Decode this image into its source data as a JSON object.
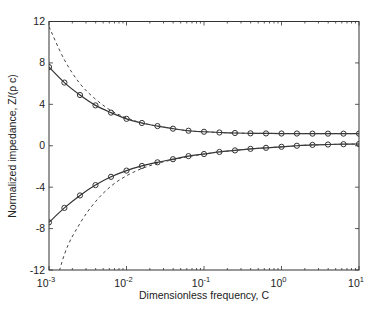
{
  "chart_data": {
    "type": "line",
    "title": "",
    "xlabel": "Dimensionless frequency, C",
    "ylabel": "Normalized impedance, Z/(ρ c)",
    "xscale": "log",
    "xlim": [
      0.001,
      10
    ],
    "ylim": [
      -12,
      12
    ],
    "grid": false,
    "legend": null,
    "x_ticks": [
      {
        "value": 0.001,
        "base": "10",
        "exp": "-3"
      },
      {
        "value": 0.01,
        "base": "10",
        "exp": "-2"
      },
      {
        "value": 0.1,
        "base": "10",
        "exp": "-1"
      },
      {
        "value": 1,
        "base": "10",
        "exp": "0"
      },
      {
        "value": 10,
        "base": "10",
        "exp": "1"
      }
    ],
    "y_ticks": [
      {
        "value": 12,
        "label": "12"
      },
      {
        "value": 8,
        "label": "8"
      },
      {
        "value": 4,
        "label": "4"
      },
      {
        "value": 0,
        "label": "0"
      },
      {
        "value": -4,
        "label": "-4"
      },
      {
        "value": -8,
        "label": "-8"
      },
      {
        "value": -12,
        "label": "-12"
      }
    ],
    "x": [
      0.001,
      0.00158,
      0.00251,
      0.00398,
      0.00631,
      0.01,
      0.0158,
      0.0251,
      0.0398,
      0.0631,
      0.1,
      0.158,
      0.251,
      0.398,
      0.631,
      1,
      1.58,
      2.51,
      3.98,
      6.31,
      10
    ],
    "series": [
      {
        "name": "Real part (exact)",
        "style": "solid-circle-markers",
        "color": "#333333",
        "values": [
          7.6,
          6.1,
          4.9,
          3.9,
          3.2,
          2.6,
          2.2,
          1.9,
          1.65,
          1.45,
          1.35,
          1.28,
          1.23,
          1.2,
          1.19,
          1.18,
          1.18,
          1.17,
          1.17,
          1.17,
          1.17
        ]
      },
      {
        "name": "Imaginary part (exact)",
        "style": "solid-circle-markers",
        "color": "#333333",
        "values": [
          -7.4,
          -6.0,
          -4.8,
          -3.8,
          -3.0,
          -2.4,
          -1.95,
          -1.6,
          -1.3,
          -1.0,
          -0.8,
          -0.6,
          -0.45,
          -0.3,
          -0.2,
          -0.1,
          0.0,
          0.08,
          0.12,
          0.15,
          0.17
        ]
      },
      {
        "name": "Real part (approximation)",
        "style": "dashed",
        "color": "#444444",
        "values": [
          11.5,
          8.3,
          6.0,
          4.5,
          3.4,
          2.7,
          2.2,
          1.9,
          1.65,
          1.45,
          1.35,
          1.28,
          1.23,
          1.2,
          1.19,
          1.18,
          1.18,
          1.17,
          1.17,
          1.17,
          1.17
        ]
      },
      {
        "name": "Imaginary part (approximation)",
        "style": "dashed",
        "color": "#444444",
        "values": [
          -16.0,
          -10.5,
          -7.5,
          -5.4,
          -3.9,
          -2.9,
          -2.2,
          -1.7,
          -1.35,
          -1.05,
          -0.8,
          -0.6,
          -0.45,
          -0.3,
          -0.2,
          -0.1,
          0.0,
          0.08,
          0.12,
          0.15,
          0.17
        ]
      }
    ],
    "plot_area_px": {
      "left": 49,
      "right": 359,
      "top": 21.5,
      "bottom": 270
    }
  }
}
